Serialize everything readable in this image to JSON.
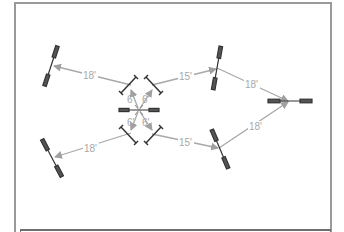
{
  "diagram": {
    "colors": {
      "frame": "#9a9a9a",
      "arrow": "#a0a0a0",
      "label": "#a8a8a8",
      "speaker": "#333333"
    },
    "labels": {
      "upper_left_distance": "18'",
      "lower_left_distance": "18'",
      "upper_mid_distance": "15'",
      "lower_mid_distance": "15'",
      "upper_right_distance": "18'",
      "lower_right_distance": "18'",
      "center_ul": "6'",
      "center_ur": "6'",
      "center_ll": "6'",
      "center_lr": "6'"
    }
  }
}
